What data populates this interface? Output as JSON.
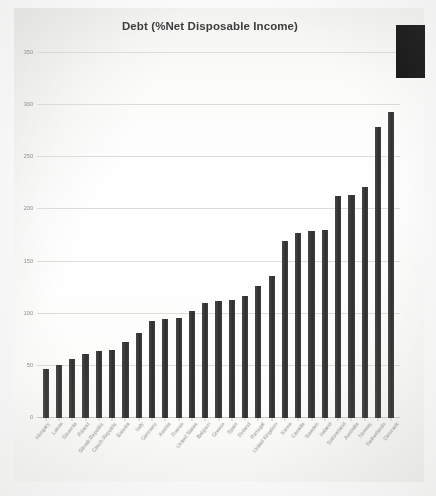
{
  "chart_data": {
    "type": "bar",
    "title": "Debt (%Net Disposable Income)",
    "xlabel": "",
    "ylabel": "",
    "ylim": [
      0,
      350
    ],
    "yticks": [
      0,
      50,
      100,
      150,
      200,
      250,
      300,
      350
    ],
    "grid": true,
    "legend": "none",
    "bar_color": "#3a3a3a",
    "categories": [
      "Hungary",
      "Latvia",
      "Slovenia",
      "Poland",
      "Slovak Republic",
      "Czech Republic",
      "Estonia",
      "Italy",
      "Germany",
      "Austria",
      "France",
      "United States",
      "Belgium",
      "Greece",
      "Spain",
      "Finland",
      "Portugal",
      "United Kingdom",
      "Korea",
      "Canada",
      "Sweden",
      "Ireland",
      "Switzerland",
      "Australia",
      "Norway",
      "Netherlands",
      "Denmark"
    ],
    "values": [
      47,
      51,
      57,
      61,
      64,
      65,
      73,
      82,
      93,
      95,
      96,
      103,
      110,
      112,
      113,
      117,
      127,
      136,
      170,
      177,
      179,
      180,
      213,
      214,
      222,
      279,
      293
    ]
  },
  "overlay": {
    "name": "dark-rectangle-occlusion"
  }
}
